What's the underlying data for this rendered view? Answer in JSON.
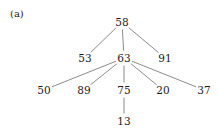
{
  "figure": {
    "panel_label": "(a)",
    "width": 219,
    "height": 133,
    "background_color": "#ffffff",
    "edge_color": "#595959",
    "text_color": "#1a1a1a"
  },
  "chart_data": {
    "type": "diagram",
    "diagram_kind": "tree",
    "title": "(a)",
    "nodes": [
      {
        "id": "n58",
        "label": "58",
        "x": 122,
        "y": 22,
        "level": 0
      },
      {
        "id": "n53",
        "label": "53",
        "x": 85,
        "y": 58,
        "level": 1
      },
      {
        "id": "n63",
        "label": "63",
        "x": 124,
        "y": 58,
        "level": 1
      },
      {
        "id": "n91",
        "label": "91",
        "x": 165,
        "y": 58,
        "level": 1
      },
      {
        "id": "n50",
        "label": "50",
        "x": 44,
        "y": 90,
        "level": 2
      },
      {
        "id": "n89",
        "label": "89",
        "x": 84,
        "y": 90,
        "level": 2
      },
      {
        "id": "n75",
        "label": "75",
        "x": 124,
        "y": 90,
        "level": 2
      },
      {
        "id": "n20",
        "label": "20",
        "x": 163,
        "y": 90,
        "level": 2
      },
      {
        "id": "n37",
        "label": "37",
        "x": 204,
        "y": 90,
        "level": 2
      },
      {
        "id": "n13",
        "label": "13",
        "x": 124,
        "y": 121,
        "level": 3
      }
    ],
    "edges": [
      {
        "from": "n58",
        "to": "n53"
      },
      {
        "from": "n58",
        "to": "n63"
      },
      {
        "from": "n58",
        "to": "n91"
      },
      {
        "from": "n63",
        "to": "n50"
      },
      {
        "from": "n63",
        "to": "n89"
      },
      {
        "from": "n63",
        "to": "n75"
      },
      {
        "from": "n63",
        "to": "n20"
      },
      {
        "from": "n63",
        "to": "n37"
      },
      {
        "from": "n75",
        "to": "n13"
      }
    ]
  }
}
